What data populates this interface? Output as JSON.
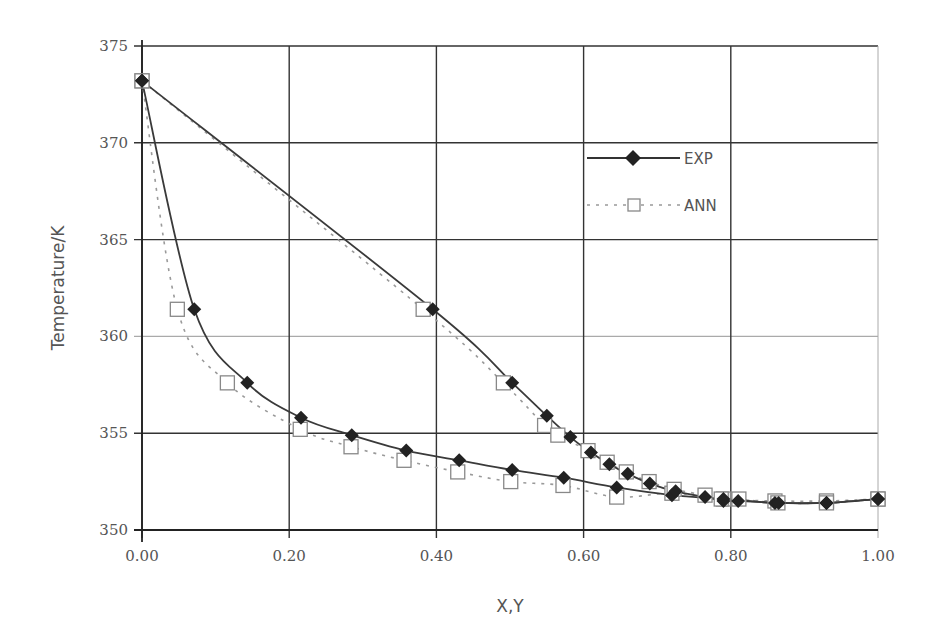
{
  "chart_data": {
    "type": "line",
    "title": "",
    "xlabel": "X,Y",
    "ylabel": "Temperature/K",
    "xlim": [
      0.0,
      1.0
    ],
    "ylim": [
      350,
      375
    ],
    "xticks": [
      "0.00",
      "0.20",
      "0.40",
      "0.60",
      "0.80",
      "1.00"
    ],
    "yticks": [
      "350",
      "355",
      "360",
      "365",
      "370",
      "375"
    ],
    "grid": true,
    "legend_position": "upper right (inside)",
    "colors": {
      "exp": "#3a3a3a",
      "ann": "#9a9a9a",
      "grid": "#333333",
      "grid_360": "#aaaaaa"
    },
    "series": [
      {
        "name": "EXP",
        "style": "solid line, filled diamond markers",
        "curve": "liquid (X)",
        "x": [
          0.0,
          0.071,
          0.143,
          0.216,
          0.285,
          0.359,
          0.431,
          0.503,
          0.573,
          0.645,
          0.72,
          0.79,
          0.86,
          0.93,
          1.0
        ],
        "y": [
          373.2,
          361.4,
          357.6,
          355.8,
          354.9,
          354.1,
          353.6,
          353.1,
          352.7,
          352.2,
          351.8,
          351.6,
          351.4,
          351.4,
          351.6
        ]
      },
      {
        "name": "EXP",
        "style": "solid line, filled diamond markers",
        "curve": "vapour (Y)",
        "x": [
          0.0,
          0.395,
          0.503,
          0.55,
          0.582,
          0.61,
          0.635,
          0.66,
          0.69,
          0.725,
          0.765,
          0.79,
          0.81,
          0.865,
          0.93,
          1.0
        ],
        "y": [
          373.2,
          361.4,
          357.6,
          355.9,
          354.8,
          354.0,
          353.4,
          352.9,
          352.4,
          352.0,
          351.7,
          351.5,
          351.5,
          351.4,
          351.4,
          351.6
        ]
      },
      {
        "name": "ANN",
        "style": "dotted line, open square markers",
        "curve": "liquid (X)",
        "x": [
          0.0,
          0.048,
          0.116,
          0.215,
          0.284,
          0.356,
          0.429,
          0.501,
          0.572,
          0.645,
          0.72,
          0.79,
          0.86,
          0.93,
          1.0
        ],
        "y": [
          373.2,
          361.4,
          357.6,
          355.2,
          354.3,
          353.6,
          353.0,
          352.5,
          352.3,
          351.7,
          351.9,
          351.6,
          351.5,
          351.5,
          351.6
        ]
      },
      {
        "name": "ANN",
        "style": "dotted line, open square markers",
        "curve": "vapour (Y)",
        "x": [
          0.0,
          0.382,
          0.491,
          0.547,
          0.565,
          0.606,
          0.632,
          0.658,
          0.689,
          0.723,
          0.765,
          0.787,
          0.811,
          0.864,
          0.93,
          1.0
        ],
        "y": [
          373.2,
          361.4,
          357.6,
          355.4,
          354.9,
          354.1,
          353.5,
          353.0,
          352.5,
          352.1,
          351.8,
          351.6,
          351.6,
          351.4,
          351.4,
          351.6
        ]
      }
    ],
    "legend": [
      {
        "label": "EXP",
        "marker": "diamond",
        "line": "solid"
      },
      {
        "label": "ANN",
        "marker": "square",
        "line": "dotted"
      }
    ]
  }
}
